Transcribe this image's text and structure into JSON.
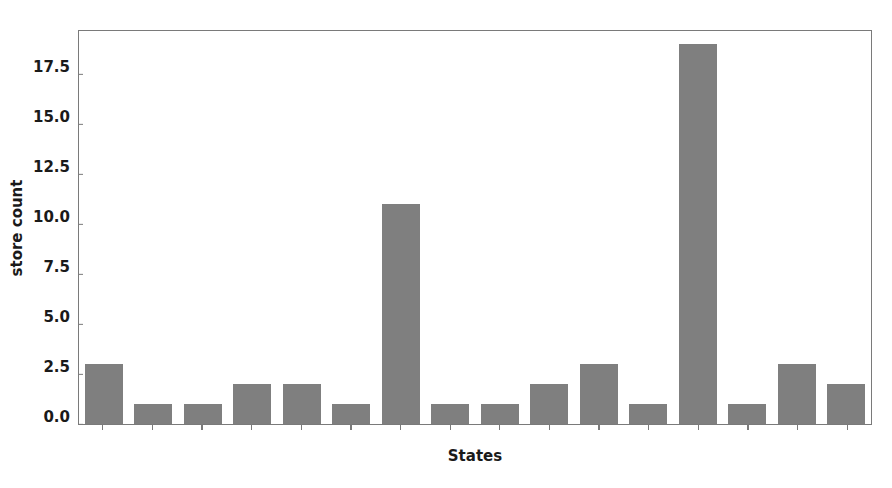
{
  "chart_data": {
    "type": "bar",
    "title": "",
    "xlabel": "States",
    "ylabel": "store count",
    "categories": [
      "",
      "",
      "",
      "",
      "",
      "",
      "",
      "",
      "",
      "",
      "",
      "",
      "",
      "",
      "",
      ""
    ],
    "values": [
      3,
      1,
      1,
      2,
      2,
      1,
      11,
      1,
      1,
      2,
      3,
      1,
      19,
      1,
      3,
      2
    ],
    "ylim": [
      0,
      19.65
    ],
    "yticks": [
      0.0,
      2.5,
      5.0,
      7.5,
      10.0,
      12.5,
      15.0,
      17.5
    ],
    "ytick_labels": [
      "0.0",
      "2.5",
      "5.0",
      "7.5",
      "10.0",
      "12.5",
      "15.0",
      "17.5"
    ],
    "xtick_labels": [],
    "grid": false,
    "legend": null,
    "bar_color": "#7f7f7f",
    "axes_edge_color": "#7a7a7a",
    "background_color": "#ffffff",
    "text_color": "#1a1a1a"
  }
}
